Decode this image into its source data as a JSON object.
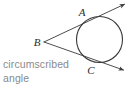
{
  "figure": {
    "caption_line_1": "circumscribed",
    "caption_line_2": "angle",
    "caption_color": "#8a8a8a",
    "stroke_color": "#3a3a3a",
    "background_color": "#ffffff",
    "labels": {
      "a": "A",
      "b": "B",
      "c": "C"
    },
    "geometry": {
      "circle": {
        "cx": 99.5,
        "cy": 39.5,
        "r": 23
      },
      "vertex_b": {
        "x": 44,
        "y": 42
      },
      "tangent_point_a": {
        "x": 83.4,
        "y": 19.5
      },
      "tangent_point_c": {
        "x": 88.0,
        "y": 61.3
      },
      "ray_a_end": {
        "x": 126,
        "y": 3
      },
      "ray_c_end": {
        "x": 125,
        "y": 71
      }
    }
  }
}
